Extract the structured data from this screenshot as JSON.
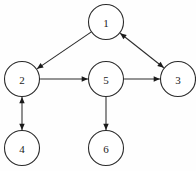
{
  "diagram": {
    "type": "directed-graph",
    "background_color": "#fefefe",
    "node_fill_color": "#ffffff",
    "node_stroke_color": "#2b2b2b",
    "edge_color": "#2b2b2b",
    "label_color": "#1a1a1a",
    "canvas": {
      "width": 196,
      "height": 171
    },
    "node_radius": 17.5,
    "nodes": [
      {
        "id": "1",
        "label": "1",
        "cx": 106,
        "cy": 22
      },
      {
        "id": "2",
        "label": "2",
        "cx": 22,
        "cy": 79
      },
      {
        "id": "3",
        "label": "3",
        "cx": 178,
        "cy": 79
      },
      {
        "id": "4",
        "label": "4",
        "cx": 22,
        "cy": 148
      },
      {
        "id": "5",
        "label": "5",
        "cx": 106,
        "cy": 79
      },
      {
        "id": "6",
        "label": "6",
        "cx": 106,
        "cy": 148
      }
    ],
    "edges": [
      {
        "id": "edge-1-2",
        "from": "1",
        "to": "2",
        "direction": "one-way",
        "arrow_at": "to"
      },
      {
        "id": "edge-1-3",
        "from": "1",
        "to": "3",
        "direction": "bidirectional",
        "arrow_at": "both"
      },
      {
        "id": "edge-2-5",
        "from": "2",
        "to": "5",
        "direction": "one-way",
        "arrow_at": "to"
      },
      {
        "id": "edge-5-3",
        "from": "5",
        "to": "3",
        "direction": "one-way",
        "arrow_at": "to"
      },
      {
        "id": "edge-2-4",
        "from": "2",
        "to": "4",
        "direction": "bidirectional",
        "arrow_at": "both"
      },
      {
        "id": "edge-5-6",
        "from": "5",
        "to": "6",
        "direction": "one-way",
        "arrow_at": "to"
      }
    ]
  }
}
